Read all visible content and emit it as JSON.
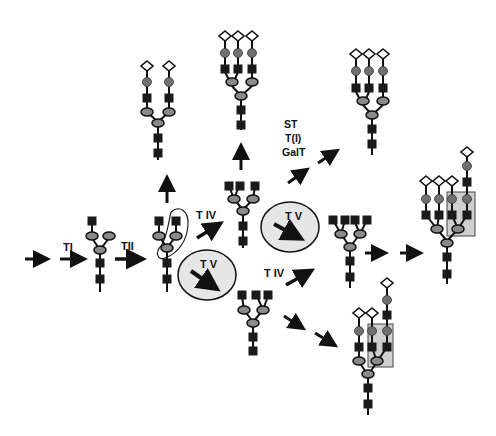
{
  "diagram": {
    "type": "N-glycan branching pathway",
    "colors": {
      "background": "#ffffff",
      "ink": "#111111",
      "hexnac_square": "#1a1a1a",
      "mannose_oval": "#8a8a8a",
      "galactose_circle": "#707070",
      "sialic_diamond": "#ffffff",
      "enzyme_circle_fill": "#e6e6e6",
      "highlight_box": "#cfcfcf"
    },
    "labels": {
      "t1": "TI",
      "t2": "TII",
      "t4_upper": "T IV",
      "t4_lower": "T IV",
      "t5_lower": "T V",
      "t5_middle": "T V",
      "st": "ST",
      "ti_paren": "T(I)",
      "galt": "GalT"
    },
    "structures": [
      {
        "id": "monoantennary",
        "description": "core with two mannose branches, one GlcNAc"
      },
      {
        "id": "biantennary",
        "description": "two GlcNAc branches (circled)"
      },
      {
        "id": "biantennary-complete",
        "description": "sialylated biantennary"
      },
      {
        "id": "triantennary-GnT-IV",
        "description": "three GlcNAc branches"
      },
      {
        "id": "triantennary-complete",
        "description": "sialylated triantennary"
      },
      {
        "id": "triantennary-complete-2",
        "description": "sialylated triantennary (right)"
      },
      {
        "id": "tetraantennary",
        "description": "four GlcNAc branches"
      },
      {
        "id": "tetraantennary-extended",
        "description": "sialylated with extension, highlighted"
      },
      {
        "id": "triantennary-GnT-V",
        "description": "three GlcNAc branches (lower)"
      },
      {
        "id": "triantennary-GnT-V-extended",
        "description": "sialylated with extension, highlighted"
      }
    ]
  }
}
